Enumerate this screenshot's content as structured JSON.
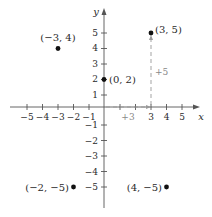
{
  "diagram": {
    "type": "coordinate-plane",
    "axes": {
      "x_label": "x",
      "y_label": "y",
      "x_ticks": [
        "−5",
        "−4",
        "−3",
        "−2",
        "−1",
        "3",
        "4",
        "5"
      ],
      "y_ticks_pos": [
        "1",
        "2",
        "3",
        "4",
        "5"
      ],
      "y_ticks_neg": [
        "−1",
        "−2",
        "−3",
        "−4",
        "−5"
      ]
    },
    "points": [
      {
        "label": "(−3, 4)",
        "x": -3,
        "y": 4
      },
      {
        "label": "(0, 2)",
        "x": 0,
        "y": 2
      },
      {
        "label": "(3, 5)",
        "x": 3,
        "y": 5
      },
      {
        "label": "(−2, −5)",
        "x": -2,
        "y": -5
      },
      {
        "label": "(4, −5)",
        "x": 4,
        "y": -5
      }
    ],
    "annotations": {
      "horizontal_move": "+3",
      "vertical_move": "+5"
    },
    "colors": {
      "axis": "#555555",
      "point": "#111111",
      "guide": "#999999"
    }
  }
}
